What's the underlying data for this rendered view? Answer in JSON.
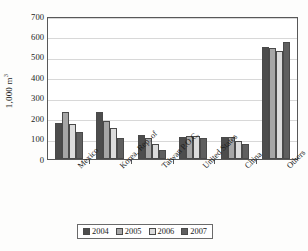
{
  "chart_data": {
    "type": "bar",
    "title": "",
    "xlabel": "",
    "ylabel": "1,000 m3",
    "ylabel_base": "1,000 m",
    "ylabel_sup": "3",
    "ylim": [
      0,
      700
    ],
    "ytick_step": 100,
    "ytick_labels": [
      "700",
      "600",
      "500",
      "400",
      "300",
      "200",
      "100",
      "0"
    ],
    "grid": true,
    "legend_position": "bottom",
    "categories": [
      "Mexico",
      "Korea, Rep. of",
      "Taiwan P.O.C.",
      "United States",
      "China",
      "Others"
    ],
    "series": [
      {
        "name": "2004",
        "color": "#4d4d4d",
        "values": [
          175,
          230,
          120,
          110,
          110,
          550
        ]
      },
      {
        "name": "2005",
        "color": "#a6a6a6",
        "values": [
          232,
          185,
          105,
          112,
          110,
          545
        ]
      },
      {
        "name": "2006",
        "color": "#dcdcdc",
        "values": [
          170,
          150,
          75,
          112,
          90,
          530
        ]
      },
      {
        "name": "2007",
        "color": "#5f5f5f",
        "values": [
          130,
          105,
          45,
          105,
          72,
          575
        ]
      }
    ]
  },
  "legend": {
    "entries": [
      "2004",
      "2005",
      "2006",
      "2007"
    ]
  }
}
